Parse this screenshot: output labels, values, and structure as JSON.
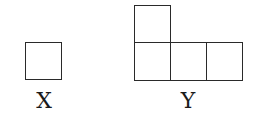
{
  "figures": [
    {
      "label": "X",
      "cells": [
        {
          "x": 25,
          "y": 42,
          "w": 37,
          "h": 38
        }
      ]
    },
    {
      "label": "Y",
      "cells": [
        {
          "x": 134,
          "y": 5,
          "w": 37,
          "h": 38
        },
        {
          "x": 134,
          "y": 43,
          "w": 37,
          "h": 38
        },
        {
          "x": 170,
          "y": 43,
          "w": 37,
          "h": 38
        },
        {
          "x": 206,
          "y": 43,
          "w": 37,
          "h": 38
        }
      ]
    }
  ],
  "colors": {
    "stroke": "#2a2a2a",
    "background": "#ffffff",
    "text": "#1a1a1a"
  }
}
